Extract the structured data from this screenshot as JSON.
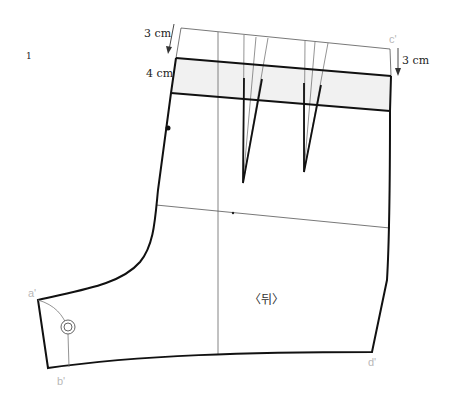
{
  "figure": {
    "page_mark": "1",
    "title": "〈뒤〉",
    "measurements": {
      "top_left": "3 cm",
      "waistband": "4 cm",
      "top_right": "3 cm"
    },
    "points": {
      "a": "a'",
      "b": "b'",
      "c": "c'",
      "d": "d'"
    },
    "colors": {
      "outline": "#111111",
      "guide": "#555555",
      "waistband_fill": "#f1f1f1",
      "point_label": "#b8b8b8"
    }
  }
}
